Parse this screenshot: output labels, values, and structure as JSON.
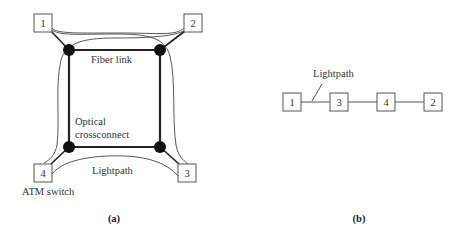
{
  "figure_a": {
    "caption": "(a)",
    "switches": [
      {
        "id": "1",
        "label": "1"
      },
      {
        "id": "2",
        "label": "2"
      },
      {
        "id": "3",
        "label": "3"
      },
      {
        "id": "4",
        "label": "4"
      }
    ],
    "labels": {
      "fiber_link": "Fiber link",
      "optical_line1": "Optical",
      "optical_line2": "crossconnect",
      "lightpath": "Lightpath",
      "atm_switch": "ATM switch"
    },
    "colors": {
      "node": "#111111",
      "line": "#222222",
      "box_border": "#555555"
    }
  },
  "figure_b": {
    "caption": "(b)",
    "chain": [
      {
        "id": "1",
        "label": "1"
      },
      {
        "id": "3",
        "label": "3"
      },
      {
        "id": "4",
        "label": "4"
      },
      {
        "id": "2",
        "label": "2"
      }
    ],
    "labels": {
      "lightpath": "Lightpath"
    }
  }
}
